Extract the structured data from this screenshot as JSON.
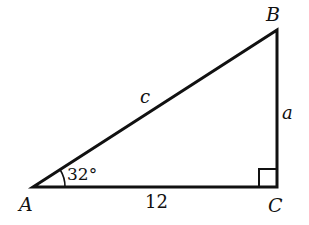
{
  "diagram": {
    "type": "right-triangle",
    "vertices": {
      "A": "A",
      "B": "B",
      "C": "C"
    },
    "sides": {
      "opposite_a": "a",
      "hypotenuse_c": "c",
      "adjacent_base": "12"
    },
    "angle_A": "32°",
    "right_angle_at": "C",
    "stroke_color": "#111111"
  }
}
